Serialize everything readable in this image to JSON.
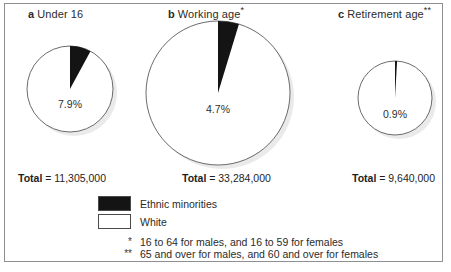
{
  "figure": {
    "border_color": "#8d8f92",
    "slice_color": "#141414",
    "base_color": "#ffffff"
  },
  "panels": [
    {
      "letter": "a",
      "title": "Under 16",
      "sup": "",
      "pct": "7.9%",
      "total_key": "Total",
      "total_eq": " = ",
      "total_value": "11,305,000"
    },
    {
      "letter": "b",
      "title": "Working age",
      "sup": "*",
      "pct": "4.7%",
      "total_key": "Total",
      "total_eq": " = ",
      "total_value": "33,284,000"
    },
    {
      "letter": "c",
      "title": "Retirement age",
      "sup": "**",
      "pct": "0.9%",
      "total_key": "Total",
      "total_eq": " = ",
      "total_value": "9,640,000"
    }
  ],
  "legend": [
    {
      "swatch": "dark",
      "label": "Ethnic minorities"
    },
    {
      "swatch": "light",
      "label": "White"
    }
  ],
  "notes": [
    {
      "mark": "*",
      "text": "16 to 64 for males, and 16 to 59 for females"
    },
    {
      "mark": "**",
      "text": "65 and over for males, and 60 and over for females"
    }
  ],
  "chart_data": {
    "type": "pie",
    "legend": [
      "Ethnic minorities",
      "White"
    ],
    "legend_position": "bottom-left",
    "charts": [
      {
        "name": "a Under 16",
        "categories": [
          "Ethnic minorities",
          "White"
        ],
        "values": [
          7.9,
          92.1
        ],
        "units": "percent",
        "total": 11305000,
        "total_label": "Total = 11,305,000",
        "radius_px": 43
      },
      {
        "name": "b Working age*",
        "categories": [
          "Ethnic minorities",
          "White"
        ],
        "values": [
          4.7,
          95.3
        ],
        "units": "percent",
        "total": 33284000,
        "total_label": "Total = 33,284,000",
        "radius_px": 72
      },
      {
        "name": "c Retirement age**",
        "categories": [
          "Ethnic minorities",
          "White"
        ],
        "values": [
          0.9,
          99.1
        ],
        "units": "percent",
        "total": 9640000,
        "total_label": "Total = 9,640,000",
        "radius_px": 37
      }
    ],
    "footnotes": [
      "* 16 to 64 for males, and 16 to 59 for females",
      "** 65 and over for males, and 60 and over for females"
    ]
  }
}
